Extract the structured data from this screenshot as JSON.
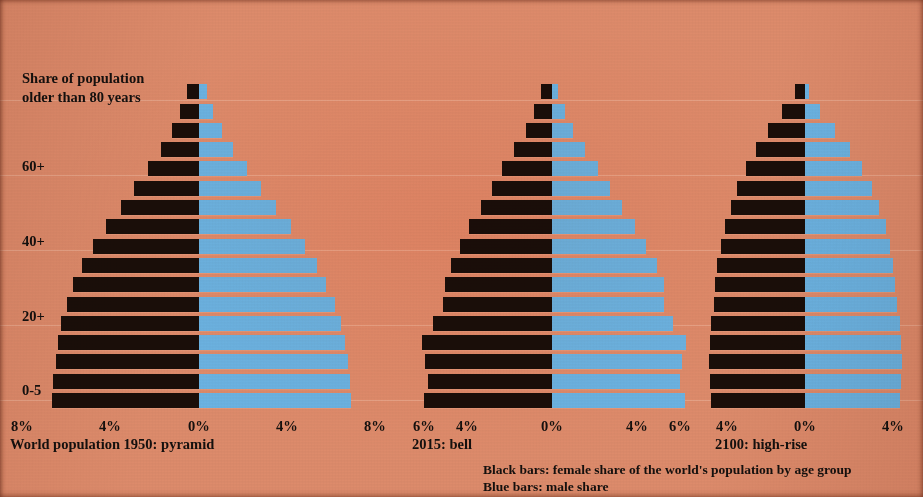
{
  "figure": {
    "title": "Share of population\nolder than 80 years",
    "background_color": "#dd8b6b",
    "female_bar_color": "#1a0e09",
    "male_bar_color": "#6bb3e3"
  },
  "y_axis": {
    "labels": [
      {
        "text": "60+",
        "top": 158
      },
      {
        "text": "40+",
        "top": 233
      },
      {
        "text": "20+",
        "top": 308
      },
      {
        "text": "0-5",
        "top": 382
      }
    ]
  },
  "legend": {
    "line1": "Black bars: female share of the world's population by age group",
    "line2": "Blue bars: male share"
  },
  "chart_data": [
    {
      "type": "bar",
      "title": "World population 1950: pyramid",
      "subtype": "population-pyramid",
      "xlabel": "",
      "ylabel": "Share of population older than 80 years",
      "grid": true,
      "legend_position": "bottom",
      "center_x": 199,
      "px_per_percent": 21.9,
      "xlim": [
        -8,
        8
      ],
      "tick_values": [
        8,
        4,
        0,
        4,
        8
      ],
      "tick_labels": [
        "8%",
        "4%",
        "0%",
        "4%",
        "8%"
      ],
      "tick_x": [
        22,
        110,
        199,
        287,
        375
      ],
      "categories": [
        "80+",
        "75+",
        "70+",
        "65+",
        "60+",
        "55+",
        "50+",
        "45+",
        "40+",
        "35+",
        "30+",
        "25+",
        "20+",
        "15+",
        "10+",
        "5+",
        "0-5"
      ],
      "series": [
        {
          "name": "female",
          "values": [
            0.55,
            0.85,
            1.25,
            1.75,
            2.35,
            2.95,
            3.55,
            4.25,
            4.85,
            5.35,
            5.75,
            6.05,
            6.3,
            6.45,
            6.55,
            6.65,
            6.7
          ]
        },
        {
          "name": "male",
          "values": [
            0.35,
            0.65,
            1.05,
            1.55,
            2.2,
            2.85,
            3.5,
            4.2,
            4.85,
            5.4,
            5.8,
            6.2,
            6.5,
            6.65,
            6.8,
            6.9,
            6.95
          ]
        }
      ]
    },
    {
      "type": "bar",
      "title": "2015: bell",
      "subtype": "population-pyramid",
      "xlabel": "",
      "ylabel": "",
      "grid": true,
      "legend_position": "bottom",
      "center_x": 552,
      "px_per_percent": 21.2,
      "xlim": [
        -6,
        6
      ],
      "tick_values": [
        6,
        4,
        0,
        4,
        6
      ],
      "tick_labels": [
        "6%",
        "4%",
        "0%",
        "4%",
        "6%"
      ],
      "tick_x": [
        424,
        467,
        552,
        637,
        680
      ],
      "categories": [
        "80+",
        "75+",
        "70+",
        "65+",
        "60+",
        "55+",
        "50+",
        "45+",
        "40+",
        "35+",
        "30+",
        "25+",
        "20+",
        "15+",
        "10+",
        "5+",
        "0-5"
      ],
      "series": [
        {
          "name": "female",
          "values": [
            0.5,
            0.85,
            1.25,
            1.8,
            2.35,
            2.85,
            3.35,
            3.9,
            4.35,
            4.75,
            5.05,
            5.15,
            5.6,
            6.15,
            6.0,
            5.85,
            6.05
          ]
        },
        {
          "name": "male",
          "values": [
            0.3,
            0.6,
            1.0,
            1.55,
            2.15,
            2.75,
            3.3,
            3.9,
            4.45,
            4.95,
            5.3,
            5.3,
            5.7,
            6.3,
            6.15,
            6.05,
            6.25
          ]
        }
      ]
    },
    {
      "type": "bar",
      "title": "2100: high-rise",
      "subtype": "population-pyramid",
      "xlabel": "",
      "ylabel": "",
      "grid": true,
      "legend_position": "bottom",
      "center_x": 805,
      "px_per_percent": 21.5,
      "xlim": [
        -4.5,
        4.5
      ],
      "tick_values": [
        4,
        0,
        4
      ],
      "tick_labels": [
        "4%",
        "0%",
        "4%"
      ],
      "tick_x": [
        727,
        805,
        893
      ],
      "categories": [
        "80+",
        "75+",
        "70+",
        "65+",
        "60+",
        "55+",
        "50+",
        "45+",
        "40+",
        "35+",
        "30+",
        "25+",
        "20+",
        "15+",
        "10+",
        "5+",
        "0-5"
      ],
      "series": [
        {
          "name": "female",
          "values": [
            0.45,
            1.05,
            1.7,
            2.3,
            2.75,
            3.15,
            3.45,
            3.7,
            3.9,
            4.1,
            4.2,
            4.25,
            4.35,
            4.4,
            4.45,
            4.4,
            4.35
          ]
        },
        {
          "name": "male",
          "values": [
            0.2,
            0.7,
            1.4,
            2.1,
            2.65,
            3.1,
            3.45,
            3.75,
            3.95,
            4.1,
            4.2,
            4.3,
            4.4,
            4.45,
            4.5,
            4.45,
            4.4
          ]
        }
      ]
    }
  ]
}
